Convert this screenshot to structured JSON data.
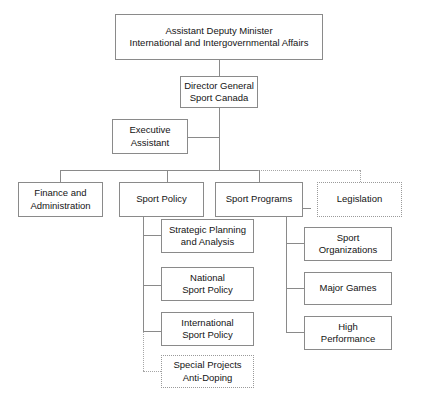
{
  "chart_title": "Sport Canada Organizational Structure",
  "nodes": {
    "adm": {
      "label": "Assistant Deputy Minister\nInternational and Intergovernmental Affairs",
      "style": "solid"
    },
    "dg": {
      "label": "Director General\nSport Canada",
      "style": "solid"
    },
    "exec_assistant": {
      "label": "Executive\nAssistant",
      "style": "solid"
    },
    "finance": {
      "label": "Finance and\nAdministration",
      "style": "solid"
    },
    "sport_policy": {
      "label": "Sport Policy",
      "style": "solid"
    },
    "sport_programs": {
      "label": "Sport Programs",
      "style": "solid"
    },
    "legislation": {
      "label": "Legislation",
      "style": "dotted"
    },
    "strategic_planning": {
      "label": "Strategic Planning\nand Analysis",
      "style": "solid"
    },
    "national_sport_policy": {
      "label": "National\nSport Policy",
      "style": "solid"
    },
    "international_sport_policy": {
      "label": "International\nSport Policy",
      "style": "solid"
    },
    "special_projects": {
      "label": "Special Projects\nAnti-Doping",
      "style": "dotted"
    },
    "sport_organizations": {
      "label": "Sport\nOrganizations",
      "style": "solid"
    },
    "major_games": {
      "label": "Major Games",
      "style": "solid"
    },
    "high_performance": {
      "label": "High\nPerformance",
      "style": "solid"
    }
  },
  "colors": {
    "border": "#8a8a8a",
    "dotted_border": "#a6a6a6",
    "text": "#141414",
    "background": "#ffffff"
  }
}
